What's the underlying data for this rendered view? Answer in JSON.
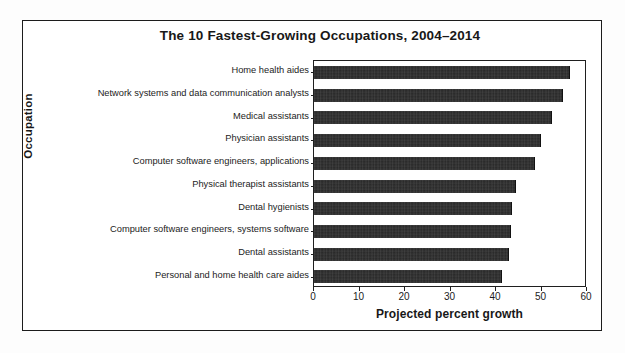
{
  "figure": {
    "border_color": "#1c1c1c",
    "background": "#ffffff",
    "bar_color": "#262626"
  },
  "chart_data": {
    "type": "bar",
    "orientation": "horizontal",
    "title": "The 10 Fastest-Growing Occupations, 2004–2014",
    "xlabel": "Projected percent growth",
    "ylabel": "Occupation",
    "xlim": [
      0,
      60
    ],
    "xticks": [
      0,
      10,
      20,
      30,
      40,
      50,
      60
    ],
    "xtick_labels": [
      "0",
      "10",
      "20",
      "30",
      "40",
      "50",
      "60"
    ],
    "grid": false,
    "legend": null,
    "categories": [
      "Home health aides",
      "Network systems and data communication analysts",
      "Medical assistants",
      "Physician assistants",
      "Computer software engineers, applications",
      "Physical therapist assistants",
      "Dental hygienists",
      "Computer software engineers, systems software",
      "Dental assistants",
      "Personal and home health care aides"
    ],
    "values": [
      56,
      54.6,
      52.1,
      49.6,
      48.4,
      44.2,
      43.3,
      43,
      42.7,
      41
    ]
  }
}
